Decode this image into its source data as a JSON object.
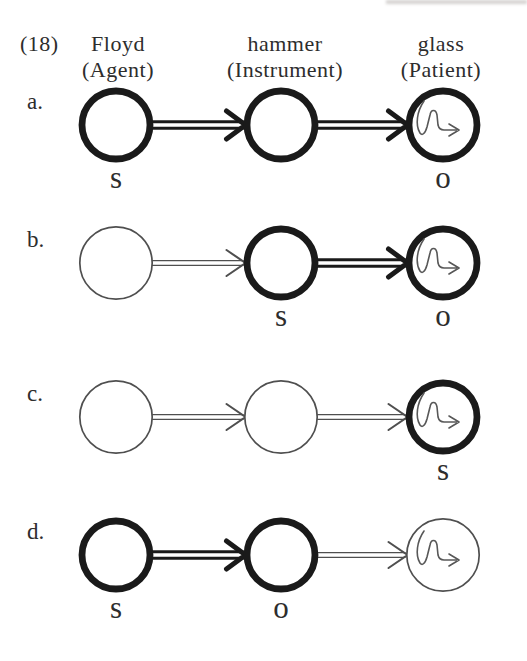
{
  "figure": {
    "item_number": "(18)",
    "columns": [
      {
        "word": "Floyd",
        "role": "(Agent)"
      },
      {
        "word": "hammer",
        "role": "(Instrument)"
      },
      {
        "word": "glass",
        "role": "(Patient)"
      }
    ],
    "rows": [
      {
        "label": "a.",
        "circles": [
          {
            "entity": "agent",
            "profiled": true,
            "squiggle": false
          },
          {
            "entity": "instrument",
            "profiled": true,
            "squiggle": false
          },
          {
            "entity": "patient",
            "profiled": true,
            "squiggle": true
          }
        ],
        "arrows": [
          {
            "profiled": true
          },
          {
            "profiled": true
          }
        ],
        "relations": [
          {
            "circle": 0,
            "text": "s"
          },
          {
            "circle": 2,
            "text": "o"
          }
        ]
      },
      {
        "label": "b.",
        "circles": [
          {
            "entity": "agent",
            "profiled": false,
            "squiggle": false
          },
          {
            "entity": "instrument",
            "profiled": true,
            "squiggle": false
          },
          {
            "entity": "patient",
            "profiled": true,
            "squiggle": true
          }
        ],
        "arrows": [
          {
            "profiled": false
          },
          {
            "profiled": true
          }
        ],
        "relations": [
          {
            "circle": 1,
            "text": "s"
          },
          {
            "circle": 2,
            "text": "o"
          }
        ]
      },
      {
        "label": "c.",
        "circles": [
          {
            "entity": "agent",
            "profiled": false,
            "squiggle": false
          },
          {
            "entity": "instrument",
            "profiled": false,
            "squiggle": false
          },
          {
            "entity": "patient",
            "profiled": true,
            "squiggle": true
          }
        ],
        "arrows": [
          {
            "profiled": false
          },
          {
            "profiled": false
          }
        ],
        "relations": [
          {
            "circle": 2,
            "text": "s"
          }
        ]
      },
      {
        "label": "d.",
        "circles": [
          {
            "entity": "agent",
            "profiled": true,
            "squiggle": false
          },
          {
            "entity": "instrument",
            "profiled": true,
            "squiggle": false
          },
          {
            "entity": "patient",
            "profiled": false,
            "squiggle": true
          }
        ],
        "arrows": [
          {
            "profiled": true
          },
          {
            "profiled": false
          }
        ],
        "relations": [
          {
            "circle": 0,
            "text": "s"
          },
          {
            "circle": 1,
            "text": "o"
          }
        ]
      }
    ],
    "colors": {
      "ink_bold": "#1a1a1a",
      "ink_thin": "#4f4f4f",
      "squiggle": "#585858",
      "text": "#2d2d2d",
      "paper": "#ffffff"
    }
  }
}
